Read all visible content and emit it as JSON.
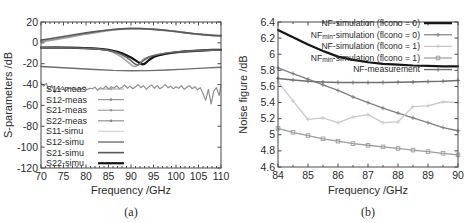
{
  "figure": {
    "background": "#ffffff",
    "panels": [
      "a",
      "b"
    ]
  },
  "panel_a": {
    "subcaption": "(a)",
    "legend": {
      "position": "lower-left",
      "entries": [
        {
          "label": "S11-meas",
          "color": "#a8a8a8",
          "style": "marker-line",
          "width": 1.1
        },
        {
          "label": "S12-meas",
          "color": "#8f8f8f",
          "style": "marker-line",
          "width": 1.1
        },
        {
          "label": "S21-meas",
          "color": "#9a9a9a",
          "style": "marker-line",
          "width": 1.1
        },
        {
          "label": "S22-meas",
          "color": "#868686",
          "style": "marker-line",
          "width": 1.1
        },
        {
          "label": "S11-simu",
          "color": "#d8d8d8",
          "style": "line",
          "width": 1.4
        },
        {
          "label": "S12-simu",
          "color": "#6e6e6e",
          "style": "line",
          "width": 1.4
        },
        {
          "label": "S21-simu",
          "color": "#5a5a5a",
          "style": "line",
          "width": 1.6
        },
        {
          "label": "S22-simu",
          "color": "#141414",
          "style": "line",
          "width": 2.2
        }
      ]
    },
    "chart_data": {
      "type": "line",
      "title": "",
      "xlabel": "Frequency /GHz",
      "ylabel": "S-parameters /dB",
      "xlim": [
        70,
        110
      ],
      "ylim": [
        -120,
        20
      ],
      "xticks": [
        70,
        75,
        80,
        85,
        90,
        95,
        100,
        105,
        110
      ],
      "yticks": [
        20,
        0,
        -20,
        -40,
        -60,
        -80,
        -100,
        -120
      ],
      "grid": false,
      "series": [
        {
          "name": "S21-meas",
          "color": "#9a9a9a",
          "width": 2.0,
          "x": [
            70,
            72,
            74,
            76,
            78,
            80,
            82,
            84,
            86,
            88,
            90,
            92,
            94,
            96,
            98,
            100,
            102,
            104,
            106,
            108,
            110
          ],
          "y": [
            1.0,
            2.4,
            3.9,
            5.4,
            7.0,
            8.6,
            10.0,
            11.4,
            12.6,
            13.4,
            13.7,
            13.6,
            13.2,
            12.6,
            11.8,
            10.8,
            9.8,
            8.8,
            8.0,
            7.4,
            7.0
          ]
        },
        {
          "name": "S21-simu",
          "color": "#5a5a5a",
          "width": 1.6,
          "x": [
            70,
            72,
            74,
            76,
            78,
            80,
            82,
            84,
            86,
            88,
            90,
            92,
            94,
            96,
            98,
            100,
            102,
            104,
            106,
            108,
            110
          ],
          "y": [
            2.6,
            4.0,
            5.4,
            6.8,
            8.2,
            9.6,
            10.8,
            11.9,
            12.8,
            13.4,
            13.7,
            13.7,
            13.3,
            12.7,
            11.9,
            10.9,
            9.8,
            8.8,
            7.9,
            7.2,
            6.6
          ]
        },
        {
          "name": "S11-simu",
          "color": "#d8d8d8",
          "width": 1.6,
          "x": [
            70,
            74,
            78,
            80,
            82,
            84,
            85,
            86,
            87,
            88,
            89,
            90,
            90.5,
            91,
            91.5,
            92,
            93,
            94,
            95,
            96,
            97,
            98,
            100,
            102,
            104,
            106,
            108,
            110
          ],
          "y": [
            -4.2,
            -4.3,
            -4.5,
            -4.8,
            -5.4,
            -6.4,
            -7.2,
            -8.6,
            -10.4,
            -13.0,
            -16.6,
            -20.4,
            -22.0,
            -22.6,
            -21.4,
            -19.0,
            -15.4,
            -13.6,
            -12.8,
            -12.0,
            -11.2,
            -10.4,
            -9.2,
            -8.4,
            -7.8,
            -7.2,
            -6.8,
            -6.4
          ]
        },
        {
          "name": "S11-meas",
          "color": "#a8a8a8",
          "width": 1.5,
          "x": [
            70,
            73,
            76,
            79,
            81,
            83,
            84,
            85,
            86,
            87,
            88,
            89,
            90,
            90.5,
            91,
            91.5,
            92,
            93,
            94,
            95,
            96,
            97,
            98,
            100,
            102,
            104,
            106,
            108,
            110
          ],
          "y": [
            -4.4,
            -4.3,
            -4.5,
            -4.6,
            -4.9,
            -5.6,
            -6.2,
            -7.4,
            -9.0,
            -11.2,
            -14.0,
            -17.6,
            -21.0,
            -22.4,
            -22.8,
            -21.0,
            -18.4,
            -15.0,
            -13.4,
            -12.6,
            -12.0,
            -11.4,
            -10.8,
            -9.6,
            -8.8,
            -8.2,
            -7.6,
            -7.2,
            -6.8
          ]
        },
        {
          "name": "S22-simu",
          "color": "#141414",
          "width": 2.2,
          "x": [
            70,
            74,
            78,
            81,
            83,
            85,
            86,
            87,
            88,
            89,
            90,
            91,
            92,
            92.5,
            93,
            93.5,
            94,
            95,
            96,
            97,
            98,
            100,
            102,
            104,
            106,
            108,
            110
          ],
          "y": [
            -4.6,
            -4.6,
            -4.8,
            -5.2,
            -5.8,
            -6.8,
            -7.6,
            -8.6,
            -10.0,
            -11.8,
            -14.0,
            -16.8,
            -19.6,
            -20.6,
            -20.2,
            -18.4,
            -16.4,
            -13.6,
            -12.0,
            -11.0,
            -10.2,
            -9.0,
            -8.2,
            -7.6,
            -7.2,
            -6.8,
            -6.6
          ]
        },
        {
          "name": "S22-meas",
          "color": "#686868",
          "width": 1.6,
          "x": [
            70,
            74,
            78,
            81,
            83,
            85,
            86,
            87,
            88,
            89,
            90,
            90.5,
            91,
            91.5,
            92,
            92.5,
            93,
            94,
            95,
            96,
            97,
            98,
            100,
            102,
            104,
            106,
            108,
            110
          ],
          "y": [
            -4.8,
            -4.8,
            -5.0,
            -5.4,
            -6.0,
            -7.2,
            -8.2,
            -9.6,
            -11.4,
            -13.8,
            -17.0,
            -19.0,
            -20.6,
            -21.4,
            -20.0,
            -18.0,
            -16.2,
            -13.6,
            -12.2,
            -11.2,
            -10.4,
            -9.8,
            -8.8,
            -8.2,
            -7.6,
            -7.2,
            -7.0,
            -6.8
          ]
        },
        {
          "name": "S12-simu",
          "color": "#6e6e6e",
          "width": 1.4,
          "x": [
            70,
            74,
            78,
            82,
            86,
            90,
            94,
            98,
            102,
            106,
            110
          ],
          "y": [
            -22.6,
            -23.6,
            -24.6,
            -25.6,
            -26.4,
            -26.8,
            -26.6,
            -26.0,
            -25.2,
            -24.2,
            -23.4
          ]
        },
        {
          "name": "S12-meas",
          "color": "#8f8f8f",
          "width": 1.2,
          "x": [
            70,
            70.6,
            71.2,
            71.8,
            72.4,
            73,
            73.6,
            74.2,
            74.8,
            75.4,
            76,
            76.6,
            77.2,
            77.8,
            78.4,
            79,
            79.6,
            80.2,
            80.8,
            81.4,
            82,
            82.6,
            83.2,
            83.8,
            84.4,
            85,
            85.6,
            86.2,
            86.8,
            87.4,
            88,
            88.6,
            89.2,
            89.8,
            90.4,
            91,
            91.6,
            92.2,
            92.8,
            93.4,
            94,
            94.6,
            95.2,
            95.8,
            96.4,
            97,
            97.6,
            98.2,
            98.8,
            99.4,
            100,
            100.6,
            101.2,
            101.8,
            102.4,
            103,
            103.6,
            104.2,
            104.8,
            105.4,
            106,
            106.6,
            107.2,
            107.8,
            108.4,
            109,
            109.6,
            110
          ],
          "y": [
            -38.5,
            -41.5,
            -39.0,
            -45.5,
            -41.0,
            -47.5,
            -43.0,
            -45.0,
            -42.0,
            -46.5,
            -43.5,
            -44.0,
            -42.5,
            -45.5,
            -43.0,
            -44.5,
            -42.0,
            -45.0,
            -43.5,
            -44.0,
            -42.5,
            -45.5,
            -43.0,
            -44.0,
            -41.5,
            -44.5,
            -42.0,
            -43.5,
            -41.0,
            -44.0,
            -42.5,
            -40.5,
            -43.5,
            -41.5,
            -44.0,
            -42.0,
            -40.0,
            -43.0,
            -41.0,
            -44.5,
            -42.0,
            -40.5,
            -43.5,
            -41.0,
            -44.0,
            -42.5,
            -40.0,
            -43.0,
            -41.5,
            -44.0,
            -42.0,
            -43.5,
            -41.0,
            -44.5,
            -42.5,
            -41.0,
            -44.0,
            -42.0,
            -45.0,
            -43.0,
            -48.5,
            -55.0,
            -44.5,
            -58.5,
            -46.0,
            -43.0,
            -50.5,
            -41.0
          ]
        }
      ]
    }
  },
  "panel_b": {
    "subcaption": "(b)",
    "legend": {
      "position": "upper-right",
      "entries": [
        {
          "label": "NF-simulation (flcono = 0)",
          "color": "#151515",
          "style": "line",
          "width": 2.2,
          "marker": "none"
        },
        {
          "label": "NF",
          "sub": "min",
          "label_tail": "-simulation (flcono = 0)",
          "color": "#808080",
          "style": "marker-line",
          "width": 1.2,
          "marker": "plus"
        },
        {
          "label": "NF-simulation (flcono = 1)",
          "color": "#c4c4c4",
          "style": "marker-line",
          "width": 1.2,
          "marker": "plus"
        },
        {
          "label": "NF",
          "sub": "min",
          "label_tail": "-simulation (flcono = 1)",
          "color": "#9c9c9c",
          "style": "marker-line",
          "width": 1.2,
          "marker": "square"
        },
        {
          "label": "NF-measurement",
          "color": "#707070",
          "style": "marker-line",
          "width": 1.4,
          "marker": "plus"
        }
      ]
    },
    "chart_data": {
      "type": "line",
      "title": "",
      "xlabel": "Frequency /GHz",
      "ylabel": "Noise figure /dB",
      "xlim": [
        84,
        90
      ],
      "ylim": [
        4.6,
        6.4
      ],
      "xticks": [
        84,
        85,
        86,
        87,
        88,
        89,
        90
      ],
      "yticks": [
        4.6,
        4.8,
        5.0,
        5.2,
        5.4,
        5.6,
        5.8,
        6.0,
        6.2,
        6.4
      ],
      "ytick_labels": [
        "4.6",
        "4.8",
        "5",
        "5.2",
        "5.4",
        "5.6",
        "5.8",
        "6",
        "6.2",
        "6.4"
      ],
      "grid": false,
      "series": [
        {
          "name": "NF-simulation (flcono = 0)",
          "color": "#151515",
          "width": 2.2,
          "marker": "none",
          "x": [
            84,
            84.5,
            85,
            85.5,
            86,
            86.5,
            87,
            87.5,
            88,
            88.5,
            89,
            89.5,
            90
          ],
          "y": [
            6.3,
            6.21,
            6.12,
            6.04,
            5.97,
            5.93,
            5.9,
            5.88,
            5.87,
            5.86,
            5.855,
            5.85,
            5.85
          ]
        },
        {
          "name": "NFmin-simulation (flcono = 0)",
          "color": "#808080",
          "width": 1.3,
          "marker": "plus",
          "x": [
            84,
            84.5,
            85,
            85.5,
            86,
            86.5,
            87,
            87.5,
            88,
            88.5,
            89,
            89.5,
            90
          ],
          "y": [
            5.83,
            5.76,
            5.69,
            5.62,
            5.55,
            5.47,
            5.4,
            5.33,
            5.27,
            5.21,
            5.15,
            5.09,
            5.05
          ]
        },
        {
          "name": "NF-measurement",
          "color": "#707070",
          "width": 1.5,
          "marker": "plus",
          "x": [
            84,
            84.5,
            85,
            85.5,
            86,
            86.5,
            87,
            87.5,
            88,
            88.5,
            89,
            89.5,
            90
          ],
          "y": [
            5.7,
            5.68,
            5.665,
            5.655,
            5.65,
            5.648,
            5.648,
            5.65,
            5.652,
            5.655,
            5.66,
            5.665,
            5.675
          ]
        },
        {
          "name": "NF-simulation (flcono = 1)",
          "color": "#c9c9c9",
          "width": 1.3,
          "marker": "plus",
          "x": [
            84,
            84.5,
            85,
            85.5,
            86,
            86.5,
            87,
            87.5,
            88,
            88.5,
            89,
            89.5,
            90
          ],
          "y": [
            5.66,
            5.42,
            5.19,
            5.21,
            5.15,
            5.22,
            5.25,
            5.15,
            5.16,
            5.35,
            5.36,
            5.41,
            5.4
          ]
        },
        {
          "name": "NFmin-simulation (flcono = 1)",
          "color": "#9c9c9c",
          "width": 1.3,
          "marker": "square",
          "x": [
            84,
            84.5,
            85,
            85.5,
            86,
            86.5,
            87,
            87.5,
            88,
            88.5,
            89,
            89.5,
            90
          ],
          "y": [
            5.08,
            5.03,
            4.99,
            4.95,
            4.92,
            4.89,
            4.87,
            4.85,
            4.83,
            4.81,
            4.79,
            4.77,
            4.75
          ]
        }
      ]
    }
  }
}
